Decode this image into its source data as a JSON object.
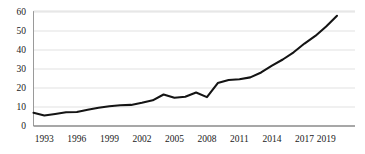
{
  "chart_data": {
    "type": "line",
    "title": "",
    "subtitle": "",
    "xlabel": "",
    "ylabel": "",
    "xlim": [
      1992,
      2020
    ],
    "ylim": [
      0,
      60
    ],
    "grid": true,
    "legend": false,
    "legend_position": "none",
    "line_color": "#141414",
    "grid_color": "#d9d9d9",
    "axis_color": "#9a9a9a",
    "y_ticks": [
      0,
      10,
      20,
      30,
      40,
      50,
      60
    ],
    "y_tick_labels": [
      "0",
      "10",
      "20",
      "30",
      "40",
      "50",
      "60"
    ],
    "x_tick_labels": [
      "1993",
      "1996",
      "1999",
      "2002",
      "2005",
      "2008",
      "2011",
      "2014",
      "2017",
      "2019"
    ],
    "x_tick_values": [
      1993,
      1996,
      1999,
      2002,
      2005,
      2008,
      2011,
      2014,
      2017,
      2019
    ],
    "x": [
      1992,
      1993,
      1994,
      1995,
      1996,
      1997,
      1998,
      1999,
      2000,
      2001,
      2002,
      2003,
      2004,
      2005,
      2006,
      2007,
      2008,
      2009,
      2010,
      2011,
      2012,
      2013,
      2014,
      2015,
      2016,
      2017,
      2018,
      2019,
      2020
    ],
    "values": [
      7.0,
      5.5,
      6.3,
      7.2,
      7.4,
      8.6,
      9.6,
      10.4,
      10.9,
      11.1,
      12.2,
      13.5,
      16.6,
      14.9,
      15.4,
      17.6,
      15.2,
      22.6,
      24.2,
      24.6,
      25.6,
      28.2,
      31.8,
      35.0,
      38.8,
      43.4,
      47.4,
      52.4,
      58.0
    ],
    "series": [
      {
        "name": "series-1",
        "values": [
          7.0,
          5.5,
          6.3,
          7.2,
          7.4,
          8.6,
          9.6,
          10.4,
          10.9,
          11.1,
          12.2,
          13.5,
          16.6,
          14.9,
          15.4,
          17.6,
          15.2,
          22.6,
          24.2,
          24.6,
          25.6,
          28.2,
          31.8,
          35.0,
          38.8,
          43.4,
          47.4,
          52.4,
          58.0
        ]
      }
    ]
  }
}
